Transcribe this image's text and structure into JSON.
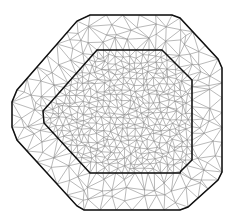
{
  "figure": {
    "type": "triangular-mesh",
    "width": 234,
    "height": 221,
    "colors": {
      "background": "#ffffff",
      "mesh_edge": "#8a8a8a",
      "boundary": "#111111"
    },
    "outer_boundary": [
      [
        90,
        15
      ],
      [
        172,
        15
      ],
      [
        180,
        18
      ],
      [
        218,
        59
      ],
      [
        222,
        68
      ],
      [
        222,
        172
      ],
      [
        218,
        180
      ],
      [
        188,
        207
      ],
      [
        180,
        210
      ],
      [
        84,
        210
      ],
      [
        77,
        206
      ],
      [
        17,
        140
      ],
      [
        12,
        127
      ],
      [
        12,
        102
      ],
      [
        17,
        90
      ],
      [
        77,
        21
      ]
    ],
    "inner_boundary": [
      [
        97,
        50
      ],
      [
        162,
        50
      ],
      [
        192,
        80
      ],
      [
        192,
        160
      ],
      [
        181,
        171
      ],
      [
        180,
        173
      ],
      [
        90,
        173
      ],
      [
        44,
        123
      ],
      [
        43,
        111
      ]
    ],
    "outer_spacing": 16,
    "inner_spacing": 6.5
  }
}
